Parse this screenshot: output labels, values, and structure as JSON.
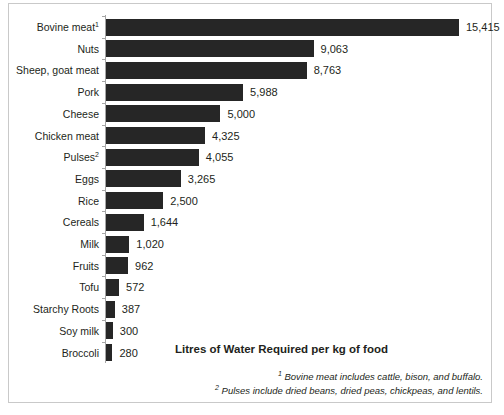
{
  "chart_data": {
    "type": "bar",
    "orientation": "horizontal",
    "title": "Litres of Water Required per kg of food",
    "xlabel": "",
    "ylabel": "",
    "grid": false,
    "legend": null,
    "xlim": [
      0,
      15415
    ],
    "categories": [
      "Bovine meat",
      "Nuts",
      "Sheep, goat meat",
      "Pork",
      "Cheese",
      "Chicken meat",
      "Pulses",
      "Eggs",
      "Rice",
      "Cereals",
      "Milk",
      "Fruits",
      "Tofu",
      "Starchy Roots",
      "Soy milk",
      "Broccoli"
    ],
    "category_footnote_markers": [
      "1",
      "",
      "",
      "",
      "",
      "",
      "2",
      "",
      "",
      "",
      "",
      "",
      "",
      "",
      "",
      ""
    ],
    "values": [
      15415,
      9063,
      8763,
      5988,
      5000,
      4325,
      4055,
      3265,
      2500,
      1644,
      1020,
      962,
      572,
      387,
      300,
      280
    ],
    "value_labels": [
      "15,415",
      "9,063",
      "8,763",
      "5,988",
      "5,000",
      "4,325",
      "4,055",
      "3,265",
      "2,500",
      "1,644",
      "1,020",
      "962",
      "572",
      "387",
      "300",
      "280"
    ],
    "bar_color": "#262626",
    "axis_color": "#a6a6a6"
  },
  "footnotes": [
    {
      "marker": "1",
      "text": "Bovine meat includes cattle, bison, and buffalo."
    },
    {
      "marker": "2",
      "text": "Pulses include dried beans, dried peas, chickpeas, and lentils."
    }
  ]
}
